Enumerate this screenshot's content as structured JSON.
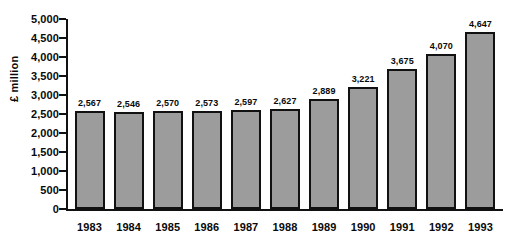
{
  "chart_data": {
    "type": "bar",
    "title": "",
    "subtitle": "",
    "xlabel": "",
    "ylabel": "£ million",
    "ylim": [
      0,
      5000
    ],
    "ytick_interval": 500,
    "ytick_labels": [
      "5,000",
      "4,500",
      "4,000",
      "3,500",
      "3,000",
      "2,500",
      "2,000",
      "1,500",
      "1,000",
      "500",
      "0"
    ],
    "ytick_values": [
      5000,
      4500,
      4000,
      3500,
      3000,
      2500,
      2000,
      1500,
      1000,
      500,
      0
    ],
    "grid": false,
    "legend": false,
    "legend_position": "none",
    "categories": [
      "1983",
      "1984",
      "1985",
      "1986",
      "1987",
      "1988",
      "1989",
      "1990",
      "1991",
      "1992",
      "1993"
    ],
    "values": [
      2567,
      2546,
      2570,
      2573,
      2597,
      2627,
      2889,
      3221,
      3675,
      4070,
      4647
    ],
    "value_labels": [
      "2,567",
      "2,546",
      "2,570",
      "2,573",
      "2,597",
      "2,627",
      "2,889",
      "3,221",
      "3,675",
      "4,070",
      "4,647"
    ],
    "bar_fill_color": "#9c9c9c",
    "bar_border_color": "#111111",
    "axis_color": "#111111",
    "background_color": "#ffffff",
    "text_color": "#0a0a0a"
  }
}
